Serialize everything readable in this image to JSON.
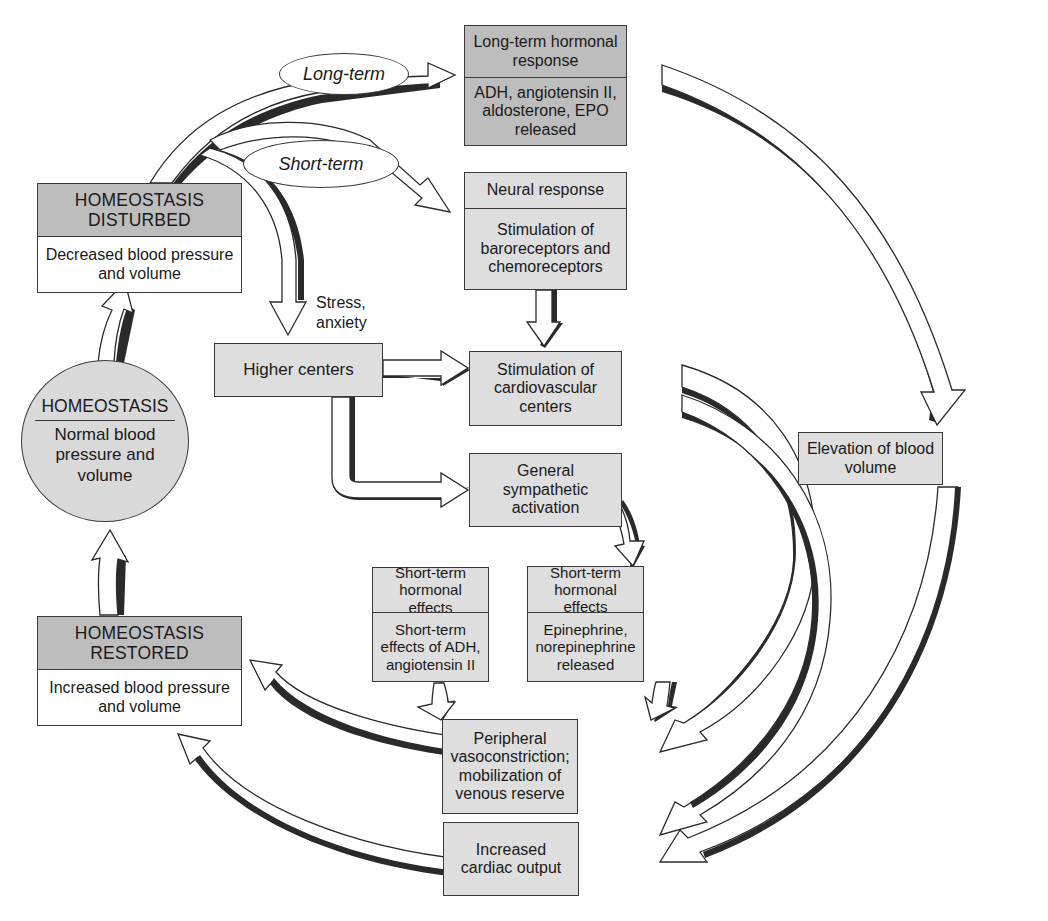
{
  "diagram": {
    "type": "flowchart",
    "colors": {
      "box_dark": "#bdbdbd",
      "box_light": "#dedede",
      "box_white": "#ffffff",
      "stroke": "#3a3a3a"
    },
    "ovals": {
      "long_term": "Long-term",
      "short_term": "Short-term"
    },
    "nodes": {
      "homeostasis_disturbed": {
        "header": "HOMEOSTASIS DISTURBED",
        "body": "Decreased blood pressure and volume"
      },
      "homeostasis": {
        "header": "HOMEOSTASIS",
        "body": "Normal blood pressure and volume"
      },
      "homeostasis_restored": {
        "header": "HOMEOSTASIS RESTORED",
        "body": "Increased blood pressure and volume"
      },
      "long_term_hormonal": {
        "header": "Long-term hormonal response",
        "body": "ADH, angiotensin II, aldosterone, EPO released"
      },
      "neural_response": {
        "header": "Neural response",
        "body": "Stimulation of baroreceptors and chemoreceptors"
      },
      "higher_centers": {
        "body": "Higher centers"
      },
      "cardiovascular_centers": {
        "body": "Stimulation of cardiovascular centers"
      },
      "sympathetic_activation": {
        "body": "General sympathetic activation"
      },
      "st_hormonal_adh": {
        "header": "Short-term hormonal effects",
        "body": "Short-term effects of ADH, angiotensin II"
      },
      "st_hormonal_epi": {
        "header": "Short-term hormonal effects",
        "body": "Epinephrine, norepinephrine released"
      },
      "peripheral_vasoconstriction": {
        "body": "Peripheral vasoconstriction; mobilization of venous reserve"
      },
      "cardiac_output": {
        "body": "Increased cardiac output"
      },
      "blood_volume": {
        "body": "Elevation of blood volume"
      }
    },
    "labels": {
      "stress": "Stress, anxiety"
    },
    "edges": [
      {
        "from": "homeostasis",
        "to": "homeostasis_disturbed"
      },
      {
        "from": "homeostasis_disturbed",
        "to": "long_term_hormonal",
        "label": "Long-term"
      },
      {
        "from": "homeostasis_disturbed",
        "to": "neural_response",
        "label": "Short-term"
      },
      {
        "from": "homeostasis_disturbed",
        "to": "higher_centers",
        "label": "Stress, anxiety"
      },
      {
        "from": "neural_response",
        "to": "cardiovascular_centers"
      },
      {
        "from": "higher_centers",
        "to": "cardiovascular_centers"
      },
      {
        "from": "higher_centers",
        "to": "sympathetic_activation"
      },
      {
        "from": "sympathetic_activation",
        "to": "st_hormonal_epi"
      },
      {
        "from": "long_term_hormonal",
        "to": "blood_volume"
      },
      {
        "from": "cardiovascular_centers",
        "to": "peripheral_vasoconstriction"
      },
      {
        "from": "cardiovascular_centers",
        "to": "cardiac_output"
      },
      {
        "from": "st_hormonal_adh",
        "to": "peripheral_vasoconstriction"
      },
      {
        "from": "st_hormonal_epi",
        "to": "peripheral_vasoconstriction"
      },
      {
        "from": "blood_volume",
        "to": "cardiac_output"
      },
      {
        "from": "peripheral_vasoconstriction",
        "to": "homeostasis_restored"
      },
      {
        "from": "cardiac_output",
        "to": "homeostasis_restored"
      },
      {
        "from": "homeostasis_restored",
        "to": "homeostasis"
      }
    ]
  }
}
